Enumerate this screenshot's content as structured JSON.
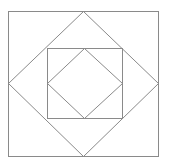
{
  "diagram": {
    "background": "#ffffff",
    "stroke_color": "#8a8a8a",
    "shapes": [
      {
        "name": "outer-square",
        "type": "rect",
        "x": 8,
        "y": 11,
        "width": 150,
        "height": 145
      },
      {
        "name": "outer-diamond",
        "type": "polygon",
        "points": "83,11 158,83 83,156 8,83"
      },
      {
        "name": "inner-square",
        "type": "rect",
        "x": 47,
        "y": 48,
        "width": 75,
        "height": 70
      },
      {
        "name": "inner-diamond",
        "type": "polygon",
        "points": "84,48 122,83 84,118 47,83"
      }
    ]
  }
}
